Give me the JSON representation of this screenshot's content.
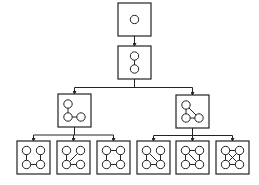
{
  "diagram": {
    "title": "",
    "kind": "tree of graph patterns (subgraph growth)",
    "colors": {
      "stroke": "#222222",
      "node_fill": "#ffffff",
      "background": "#ffffff"
    },
    "levels": [
      {
        "level": 1,
        "nodes": [
          {
            "id": "g1",
            "description": "single vertex",
            "vertices": 1,
            "edges": []
          }
        ]
      },
      {
        "level": 2,
        "nodes": [
          {
            "id": "g2",
            "parent": "g1",
            "description": "two vertices, one edge",
            "vertices": 2,
            "edges": [
              [
                "a",
                "b"
              ]
            ]
          }
        ]
      },
      {
        "level": 3,
        "nodes": [
          {
            "id": "g3a",
            "parent": "g2",
            "description": "path of three vertices",
            "vertices": 3,
            "edges": [
              [
                "tl",
                "bl"
              ],
              [
                "bl",
                "br"
              ]
            ]
          },
          {
            "id": "g3b",
            "parent": "g2",
            "description": "triangle",
            "vertices": 3,
            "edges": [
              [
                "tl",
                "bl"
              ],
              [
                "bl",
                "br"
              ],
              [
                "tl",
                "br"
              ]
            ]
          }
        ]
      },
      {
        "level": 4,
        "nodes": [
          {
            "id": "g4a",
            "parent": "g3a",
            "description": "path of four vertices",
            "vertices": 4,
            "edges": [
              [
                "tl",
                "bl"
              ],
              [
                "bl",
                "br"
              ],
              [
                "br",
                "tr"
              ]
            ]
          },
          {
            "id": "g4b",
            "parent": "g3a",
            "description": "star",
            "vertices": 4,
            "edges": [
              [
                "tl",
                "bl"
              ],
              [
                "bl",
                "br"
              ],
              [
                "bl",
                "tr"
              ]
            ]
          },
          {
            "id": "g4c",
            "parent": "g3a",
            "description": "four-cycle",
            "vertices": 4,
            "edges": [
              [
                "tl",
                "bl"
              ],
              [
                "bl",
                "br"
              ],
              [
                "br",
                "tr"
              ],
              [
                "tr",
                "tl"
              ]
            ]
          },
          {
            "id": "g4d",
            "parent": "g3b",
            "description": "triangle with pendant",
            "vertices": 4,
            "edges": [
              [
                "tl",
                "bl"
              ],
              [
                "bl",
                "br"
              ],
              [
                "tl",
                "br"
              ],
              [
                "br",
                "tr"
              ]
            ]
          },
          {
            "id": "g4e",
            "parent": "g3b",
            "description": "diamond",
            "vertices": 4,
            "edges": [
              [
                "tl",
                "bl"
              ],
              [
                "bl",
                "br"
              ],
              [
                "tl",
                "br"
              ],
              [
                "br",
                "tr"
              ],
              [
                "tr",
                "tl"
              ]
            ]
          },
          {
            "id": "g4f",
            "parent": "g3b",
            "description": "complete graph K4",
            "vertices": 4,
            "edges": [
              [
                "tl",
                "bl"
              ],
              [
                "bl",
                "br"
              ],
              [
                "tl",
                "br"
              ],
              [
                "br",
                "tr"
              ],
              [
                "tr",
                "tl"
              ],
              [
                "bl",
                "tr"
              ]
            ]
          }
        ]
      }
    ]
  }
}
